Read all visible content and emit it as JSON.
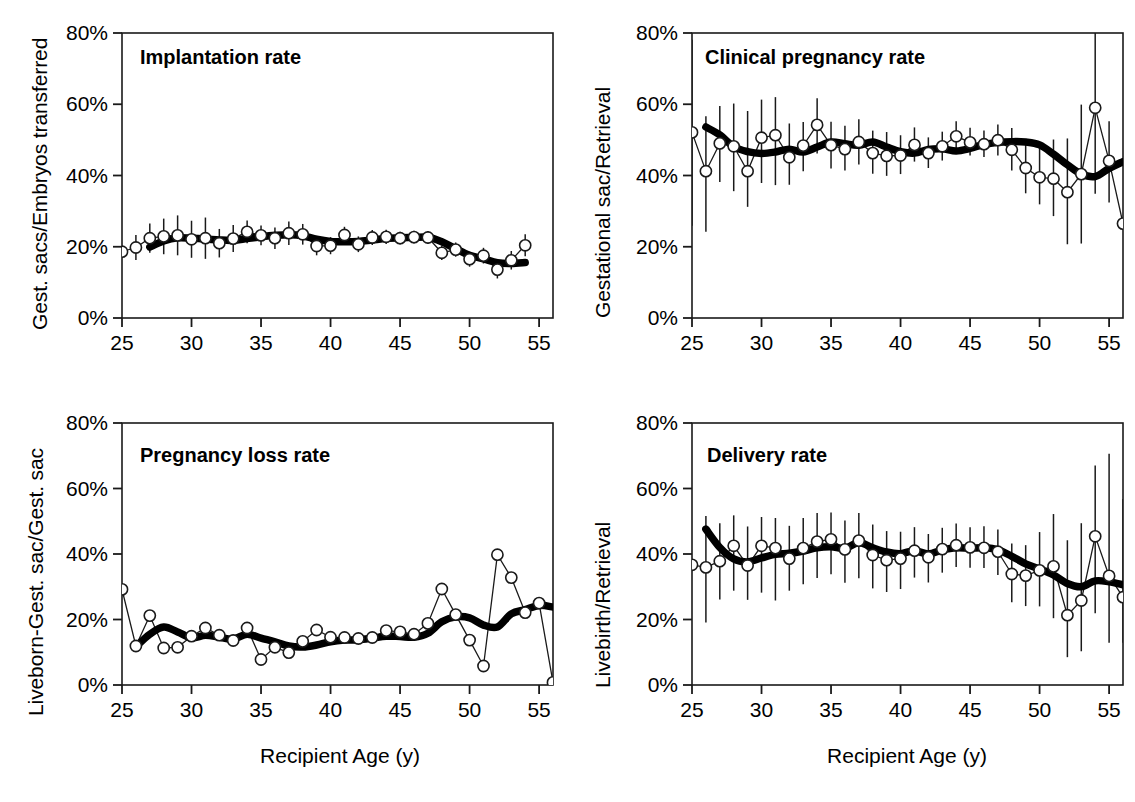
{
  "figure": {
    "background": "#ffffff",
    "marker_color": "#000000",
    "line_color": "#000000",
    "smooth_color": "#000000",
    "panel_count": 4
  },
  "axes": {
    "x_ticks": [
      "25",
      "30",
      "35",
      "40",
      "45",
      "50",
      "55"
    ],
    "x_tick_values": [
      25,
      30,
      35,
      40,
      45,
      50,
      55
    ],
    "y_ticks": [
      "0%",
      "20%",
      "40%",
      "60%",
      "80%"
    ],
    "y_tick_values": [
      0,
      20,
      40,
      60,
      80
    ],
    "xlim": [
      25,
      56
    ],
    "ylim": [
      0,
      80
    ],
    "xlabel": "Recipient Age (y)"
  },
  "chart_data": [
    {
      "id": "implantation-rate",
      "type": "line",
      "title": "Implantation rate",
      "xlabel": "",
      "ylabel": "Gest. sacs/Embryos transferred",
      "xlim": [
        25,
        56
      ],
      "ylim": [
        0,
        80
      ],
      "grid": false,
      "legend": "none",
      "x": [
        25,
        26,
        27,
        28,
        29,
        30,
        31,
        32,
        33,
        34,
        35,
        36,
        37,
        38,
        39,
        40,
        41,
        42,
        43,
        44,
        45,
        46,
        47,
        48,
        49,
        50,
        51,
        52,
        53,
        54
      ],
      "series": [
        {
          "name": "Observed rate (open circles with 95% CI)",
          "values": [
            18.6,
            19.8,
            22.4,
            22.9,
            23.2,
            22.1,
            22.4,
            21.0,
            22.3,
            24.2,
            23.2,
            22.4,
            23.8,
            23.5,
            20.2,
            20.3,
            23.3,
            20.7,
            22.6,
            22.8,
            22.4,
            22.7,
            22.6,
            18.3,
            19.2,
            16.5,
            17.5,
            13.6,
            16.2,
            20.4
          ],
          "err_low": [
            18.6,
            16.3,
            18.3,
            17.9,
            17.6,
            16.9,
            16.6,
            17.0,
            18.5,
            21.0,
            20.4,
            19.4,
            20.5,
            20.6,
            17.6,
            17.9,
            21.0,
            18.5,
            20.5,
            20.8,
            20.6,
            20.9,
            20.8,
            16.3,
            17.2,
            14.4,
            15.3,
            11.1,
            13.6,
            17.3
          ],
          "err_high": [
            18.6,
            23.3,
            26.5,
            27.9,
            28.8,
            27.3,
            28.2,
            25.0,
            26.1,
            27.4,
            26.0,
            25.4,
            27.1,
            26.4,
            22.8,
            22.7,
            25.6,
            22.9,
            24.7,
            24.8,
            24.2,
            24.5,
            24.4,
            20.3,
            21.2,
            18.6,
            19.7,
            16.1,
            18.8,
            23.5
          ]
        },
        {
          "name": "Smoothed trend (thick line)",
          "values": [
            null,
            null,
            19.9,
            21.6,
            22.5,
            22.4,
            22.2,
            21.9,
            21.8,
            22.3,
            22.8,
            23.2,
            23.4,
            23.1,
            22.1,
            21.5,
            21.4,
            21.5,
            21.9,
            22.3,
            22.5,
            22.6,
            22.7,
            21.4,
            19.4,
            17.6,
            16.6,
            15.5,
            15.3,
            15.6
          ]
        }
      ]
    },
    {
      "id": "clinical-pregnancy-rate",
      "type": "line",
      "title": "Clinical pregnancy rate",
      "xlabel": "",
      "ylabel": "Gestational sac/Retrieval",
      "xlim": [
        25,
        56
      ],
      "ylim": [
        0,
        80
      ],
      "grid": false,
      "legend": "none",
      "x": [
        25,
        26,
        27,
        28,
        29,
        30,
        31,
        32,
        33,
        34,
        35,
        36,
        37,
        38,
        39,
        40,
        41,
        42,
        43,
        44,
        45,
        46,
        47,
        48,
        49,
        50,
        51,
        52,
        53,
        54,
        55,
        56
      ],
      "series": [
        {
          "name": "Observed rate (open circles with 95% CI)",
          "values": [
            52.1,
            41.2,
            49.0,
            48.2,
            41.2,
            50.6,
            51.3,
            45.1,
            48.4,
            54.2,
            48.5,
            47.4,
            49.4,
            46.3,
            45.5,
            45.6,
            48.6,
            46.3,
            48.2,
            51.0,
            49.3,
            48.8,
            49.9,
            47.2,
            42.1,
            39.5,
            39.1,
            35.3,
            40.4,
            59.0,
            44.1,
            26.5
          ],
          "err_low": [
            25.9,
            24.2,
            38.2,
            35.6,
            31.2,
            37.9,
            37.3,
            37.4,
            41.2,
            46.2,
            42.0,
            41.4,
            43.1,
            40.5,
            39.9,
            40.4,
            43.9,
            42.1,
            44.2,
            47.0,
            45.6,
            45.2,
            45.6,
            41.4,
            35.0,
            31.9,
            28.6,
            20.7,
            20.9,
            34.9,
            32.4,
            26.5
          ],
          "err_high": [
            78.1,
            56.6,
            59.5,
            60.2,
            58.1,
            61.3,
            62.0,
            54.6,
            55.0,
            61.7,
            55.1,
            54.0,
            55.8,
            52.6,
            52.2,
            51.3,
            53.5,
            50.7,
            52.3,
            55.2,
            53.4,
            52.6,
            54.3,
            53.3,
            49.6,
            48.0,
            50.1,
            50.4,
            59.9,
            80.0,
            55.2,
            26.5
          ]
        },
        {
          "name": "Smoothed trend (thick line)",
          "values": [
            null,
            53.6,
            51.4,
            48.1,
            46.7,
            46.2,
            46.6,
            47.4,
            46.6,
            48.0,
            49.4,
            48.9,
            48.5,
            49.4,
            48.0,
            46.7,
            46.3,
            47.3,
            47.5,
            46.9,
            47.6,
            48.7,
            49.3,
            49.5,
            49.4,
            48.6,
            46.0,
            43.0,
            40.4,
            39.7,
            42.0,
            43.9,
            41.6
          ]
        }
      ]
    },
    {
      "id": "pregnancy-loss-rate",
      "type": "line",
      "title": "Pregnancy loss rate",
      "xlabel": "Recipient Age (y)",
      "ylabel": "Liveborn-Gest. sac/Gest. sac",
      "xlim": [
        25,
        56
      ],
      "ylim": [
        0,
        80
      ],
      "grid": false,
      "legend": "none",
      "x": [
        25,
        26,
        27,
        28,
        29,
        30,
        31,
        32,
        33,
        34,
        35,
        36,
        37,
        38,
        39,
        40,
        41,
        42,
        43,
        44,
        45,
        46,
        47,
        48,
        49,
        50,
        51,
        52,
        53,
        54,
        55,
        56
      ],
      "series": [
        {
          "name": "Observed rate (open circles)",
          "values": [
            29.2,
            11.9,
            21.2,
            11.3,
            11.5,
            14.9,
            17.4,
            15.2,
            13.6,
            17.4,
            7.8,
            11.5,
            9.9,
            13.3,
            16.8,
            14.6,
            14.5,
            14.2,
            14.5,
            16.6,
            16.2,
            15.5,
            18.8,
            29.3,
            21.5,
            13.7,
            5.8,
            39.8,
            32.8,
            22.1,
            25.0,
            0.8
          ]
        },
        {
          "name": "Smoothed trend (thick line)",
          "values": [
            null,
            11.7,
            15.5,
            17.7,
            16.2,
            14.4,
            15.2,
            14.6,
            14.0,
            15.5,
            14.3,
            13.2,
            11.9,
            11.6,
            12.2,
            13.2,
            13.7,
            13.8,
            14.3,
            14.9,
            14.8,
            14.6,
            15.8,
            19.3,
            20.8,
            20.5,
            18.3,
            17.7,
            21.7,
            23.0,
            24.3,
            23.8
          ]
        }
      ]
    },
    {
      "id": "delivery-rate",
      "type": "line",
      "title": "Delivery rate",
      "xlabel": "Recipient Age (y)",
      "ylabel": "Livebirth/Retrieval",
      "xlim": [
        25,
        56
      ],
      "ylim": [
        0,
        80
      ],
      "grid": false,
      "legend": "none",
      "x": [
        25,
        26,
        27,
        28,
        29,
        30,
        31,
        32,
        33,
        34,
        35,
        36,
        37,
        38,
        39,
        40,
        41,
        42,
        43,
        44,
        45,
        46,
        47,
        48,
        49,
        50,
        51,
        52,
        53,
        54,
        55,
        56
      ],
      "series": [
        {
          "name": "Observed rate (open circles with 95% CI)",
          "values": [
            36.7,
            35.9,
            37.8,
            42.5,
            36.5,
            42.5,
            41.8,
            38.6,
            41.8,
            43.8,
            44.5,
            41.4,
            44.1,
            39.7,
            38.1,
            38.6,
            41.0,
            39.0,
            41.5,
            42.7,
            42.0,
            41.9,
            40.7,
            33.9,
            33.4,
            35.0,
            36.2,
            21.3,
            25.8,
            45.4,
            33.3,
            26.8
          ],
          "err_low": [
            36.7,
            19.1,
            26.1,
            28.8,
            26.0,
            28.2,
            25.8,
            28.8,
            30.8,
            32.7,
            33.8,
            31.2,
            32.6,
            29.5,
            28.4,
            29.3,
            32.8,
            31.3,
            34.3,
            36.0,
            35.8,
            35.7,
            33.6,
            25.3,
            24.1,
            24.0,
            20.4,
            8.5,
            10.3,
            21.9,
            12.9,
            12.9
          ],
          "err_high": [
            36.7,
            51.6,
            49.4,
            51.8,
            48.4,
            51.3,
            51.0,
            48.6,
            51.0,
            52.5,
            52.7,
            50.2,
            52.5,
            49.0,
            47.0,
            46.8,
            48.2,
            46.1,
            48.0,
            49.3,
            48.2,
            48.5,
            47.5,
            43.2,
            42.7,
            46.7,
            52.2,
            44.2,
            49.4,
            67.0,
            70.6,
            56.8
          ]
        },
        {
          "name": "Smoothed trend (thick line)",
          "values": [
            null,
            47.6,
            42.0,
            38.5,
            37.6,
            38.8,
            39.9,
            40.2,
            40.9,
            41.9,
            42.2,
            41.7,
            43.5,
            41.9,
            40.6,
            40.1,
            41.0,
            40.0,
            41.2,
            41.9,
            41.8,
            41.9,
            41.3,
            39.3,
            37.0,
            35.4,
            33.6,
            31.0,
            30.0,
            31.8,
            31.5,
            30.6
          ]
        }
      ]
    }
  ]
}
